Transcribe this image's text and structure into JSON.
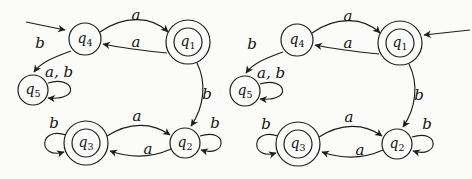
{
  "figure": {
    "background": "#fbfbfa",
    "stroke_color": "#1d1d1d",
    "alphabet": [
      "a",
      "b"
    ]
  },
  "diagrams": [
    {
      "name": "left-automaton",
      "start_state": "q4",
      "accepting_states": [
        "q1",
        "q3"
      ],
      "states": [
        {
          "id": "q4",
          "base": "q",
          "sub": "4",
          "accepting": false
        },
        {
          "id": "q1",
          "base": "q",
          "sub": "1",
          "accepting": true
        },
        {
          "id": "q5",
          "base": "q",
          "sub": "5",
          "accepting": false
        },
        {
          "id": "q3",
          "base": "q",
          "sub": "3",
          "accepting": true
        },
        {
          "id": "q2",
          "base": "q",
          "sub": "2",
          "accepting": false
        }
      ],
      "transitions": [
        {
          "from": "q4",
          "to": "q1",
          "label": "a"
        },
        {
          "from": "q1",
          "to": "q4",
          "label": "a"
        },
        {
          "from": "q4",
          "to": "q5",
          "label": "b"
        },
        {
          "from": "q5",
          "to": "q5",
          "label": "a, b"
        },
        {
          "from": "q1",
          "to": "q2",
          "label": "b"
        },
        {
          "from": "q3",
          "to": "q2",
          "label": "a"
        },
        {
          "from": "q2",
          "to": "q3",
          "label": "a"
        },
        {
          "from": "q3",
          "to": "q3",
          "label": "b"
        },
        {
          "from": "q2",
          "to": "q2",
          "label": "b"
        }
      ]
    },
    {
      "name": "right-automaton",
      "start_state": "q1",
      "accepting_states": [
        "q1",
        "q3"
      ],
      "states": [
        {
          "id": "q4",
          "base": "q",
          "sub": "4",
          "accepting": false
        },
        {
          "id": "q1",
          "base": "q",
          "sub": "1",
          "accepting": true
        },
        {
          "id": "q5",
          "base": "q",
          "sub": "5",
          "accepting": false
        },
        {
          "id": "q3",
          "base": "q",
          "sub": "3",
          "accepting": true
        },
        {
          "id": "q2",
          "base": "q",
          "sub": "2",
          "accepting": false
        }
      ],
      "transitions": [
        {
          "from": "q4",
          "to": "q1",
          "label": "a"
        },
        {
          "from": "q1",
          "to": "q4",
          "label": "a"
        },
        {
          "from": "q4",
          "to": "q5",
          "label": "b"
        },
        {
          "from": "q5",
          "to": "q5",
          "label": "a, b"
        },
        {
          "from": "q1",
          "to": "q2",
          "label": "b"
        },
        {
          "from": "q3",
          "to": "q2",
          "label": "a"
        },
        {
          "from": "q2",
          "to": "q3",
          "label": "a"
        },
        {
          "from": "q3",
          "to": "q3",
          "label": "b"
        },
        {
          "from": "q2",
          "to": "q2",
          "label": "b"
        }
      ]
    }
  ]
}
